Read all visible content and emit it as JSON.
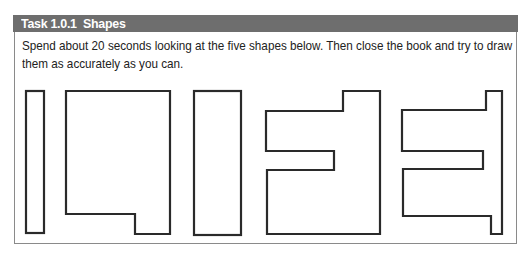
{
  "task": {
    "title": "Task 1.0.1  Shapes",
    "instructions": "Spend about 20 seconds looking at the five shapes below. Then close the book and try to draw them as accurately as you can."
  },
  "shapes": [
    {
      "id": 1,
      "type": "tall-narrow-rectangle"
    },
    {
      "id": 2,
      "type": "rectangle-with-bottom-right-extension"
    },
    {
      "id": 3,
      "type": "tall-rectangle"
    },
    {
      "id": 4,
      "type": "notched-block-with-left-slot"
    },
    {
      "id": 5,
      "type": "comb-shape-with-right-bar"
    }
  ],
  "colors": {
    "header_bg": "#6e6e6e",
    "header_text": "#ffffff",
    "border": "#8a8a8a",
    "shape_stroke": "#2a2a2a"
  }
}
